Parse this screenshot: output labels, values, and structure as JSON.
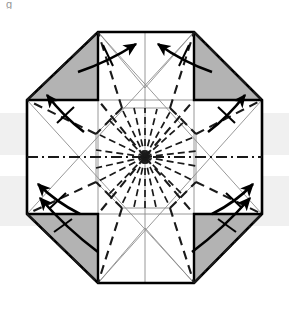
{
  "figure": {
    "kind": "origami-crease-pattern",
    "title_fragment": "g",
    "canvas": {
      "width": 289,
      "height": 311
    },
    "background_color": "#ffffff",
    "scan_band_color": "#e3e3e3",
    "shade_color": "#b3b3b3",
    "outline_color": "#000000",
    "construction_line_color": "#8d8d8d",
    "fold_line_color": "#1a1a1a",
    "arrow_color": "#000000",
    "paper_fill": "#ffffff",
    "center_point": {
      "x": 145,
      "y": 157
    },
    "octagon_label": "octagon-outline",
    "shaded_corner_count": 4,
    "arrow_count": 8,
    "radial_fold_count": 24,
    "scan_bands": [
      {
        "name": "left-band",
        "x": 0,
        "y": 113,
        "width": 289,
        "height": 42
      },
      {
        "name": "right-band",
        "x": 0,
        "y": 176,
        "width": 289,
        "height": 50
      }
    ],
    "octagon_vertices": [
      {
        "x": 98,
        "y": 32
      },
      {
        "x": 194,
        "y": 32
      },
      {
        "x": 262,
        "y": 100
      },
      {
        "x": 262,
        "y": 214
      },
      {
        "x": 194,
        "y": 283
      },
      {
        "x": 98,
        "y": 283
      },
      {
        "x": 27,
        "y": 214
      },
      {
        "x": 27,
        "y": 100
      }
    ],
    "inner_octagon_vertices": [
      {
        "x": 122,
        "y": 108
      },
      {
        "x": 170,
        "y": 108
      },
      {
        "x": 196,
        "y": 134
      },
      {
        "x": 196,
        "y": 182
      },
      {
        "x": 170,
        "y": 208
      },
      {
        "x": 122,
        "y": 208
      },
      {
        "x": 96,
        "y": 182
      },
      {
        "x": 96,
        "y": 134
      }
    ],
    "cross_outline_vertices": [
      {
        "x": 98,
        "y": 32
      },
      {
        "x": 194,
        "y": 32
      },
      {
        "x": 194,
        "y": 100
      },
      {
        "x": 262,
        "y": 100
      },
      {
        "x": 262,
        "y": 214
      },
      {
        "x": 194,
        "y": 214
      },
      {
        "x": 194,
        "y": 283
      },
      {
        "x": 98,
        "y": 283
      },
      {
        "x": 98,
        "y": 214
      },
      {
        "x": 27,
        "y": 214
      },
      {
        "x": 27,
        "y": 100
      },
      {
        "x": 98,
        "y": 100
      }
    ],
    "shaded_corners": [
      {
        "name": "shaded-corner-top-left",
        "pts": "27,100 98,32 98,100"
      },
      {
        "name": "shaded-corner-top-right",
        "pts": "194,32 262,100 194,100"
      },
      {
        "name": "shaded-corner-bottom-left",
        "pts": "27,214 98,214 98,283"
      },
      {
        "name": "shaded-corner-bottom-right",
        "pts": "194,214 262,214 194,283"
      }
    ],
    "arrows": [
      {
        "name": "arrow-top-left-inner",
        "x1": 78,
        "y1": 72,
        "x2": 136,
        "y2": 44,
        "tick": true
      },
      {
        "name": "arrow-top-right-inner",
        "x1": 212,
        "y1": 72,
        "x2": 158,
        "y2": 44,
        "tick": true
      },
      {
        "name": "arrow-left-upper",
        "x1": 84,
        "y1": 132,
        "x2": 47,
        "y2": 95,
        "tick": true
      },
      {
        "name": "arrow-right-upper",
        "x1": 208,
        "y1": 132,
        "x2": 245,
        "y2": 95,
        "tick": true
      },
      {
        "name": "arrow-left-lower",
        "x1": 84,
        "y1": 186,
        "x2": 38,
        "y2": 184,
        "tick": true
      },
      {
        "name": "arrow-right-lower",
        "x1": 208,
        "y1": 186,
        "x2": 253,
        "y2": 184,
        "tick": true
      },
      {
        "name": "arrow-bottom-left-inner",
        "x1": 98,
        "y1": 252,
        "x2": 40,
        "y2": 198,
        "tick": true
      },
      {
        "name": "arrow-bottom-right-inner",
        "x1": 192,
        "y1": 252,
        "x2": 250,
        "y2": 198,
        "tick": true
      }
    ]
  }
}
